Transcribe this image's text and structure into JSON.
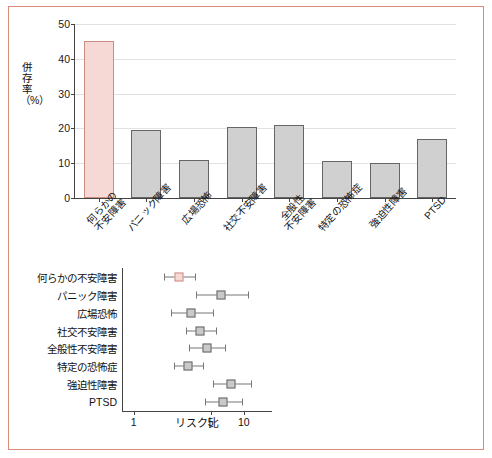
{
  "figure": {
    "border_color": "#d98a7a",
    "highlight_color": "#f6d8d4",
    "bar_color": "#d0d0d0"
  },
  "chart_data": [
    {
      "type": "bar",
      "title": "",
      "xlabel": "",
      "ylabel": "併存率（%）",
      "ylim": [
        0,
        50
      ],
      "yticks": [
        0,
        10,
        20,
        30,
        40,
        50
      ],
      "grid": true,
      "categories": [
        "何らかの\n不安障害",
        "パニック障害",
        "広場恐怖",
        "社交不安障害",
        "全般性\n不安障害",
        "特定の恐怖症",
        "強迫性障害",
        "PTSD"
      ],
      "values": [
        45,
        19.5,
        11,
        20.5,
        21,
        10.5,
        10,
        17
      ],
      "highlighted_category": "何らかの\n不安障害"
    },
    {
      "type": "scatter",
      "title": "",
      "xlabel": "リスク比",
      "ylabel": "",
      "xscale": "log",
      "xlim": [
        0.8,
        18
      ],
      "xticks": [
        1,
        5,
        10
      ],
      "categories": [
        "何らかの不安障害",
        "パニック障害",
        "広場恐怖",
        "社交不安障害",
        "全般性不安障害",
        "特定の恐怖症",
        "強迫性障害",
        "PTSD"
      ],
      "points": [
        {
          "label": "何らかの不安障害",
          "estimate": 2.6,
          "low": 1.9,
          "high": 3.6,
          "highlight": true
        },
        {
          "label": "パニック障害",
          "estimate": 6.2,
          "low": 3.7,
          "high": 11.0,
          "highlight": false
        },
        {
          "label": "広場恐怖",
          "estimate": 3.3,
          "low": 2.2,
          "high": 5.2,
          "highlight": false
        },
        {
          "label": "社交不安障害",
          "estimate": 4.0,
          "low": 3.0,
          "high": 5.6,
          "highlight": false
        },
        {
          "label": "全般性不安障害",
          "estimate": 4.6,
          "low": 3.2,
          "high": 6.8,
          "highlight": false
        },
        {
          "label": "特定の恐怖症",
          "estimate": 3.1,
          "low": 2.3,
          "high": 4.3,
          "highlight": false
        },
        {
          "label": "強迫性障害",
          "estimate": 7.6,
          "low": 5.2,
          "high": 11.5,
          "highlight": false
        },
        {
          "label": "PTSD",
          "estimate": 6.4,
          "low": 4.4,
          "high": 9.6,
          "highlight": false
        }
      ]
    }
  ]
}
